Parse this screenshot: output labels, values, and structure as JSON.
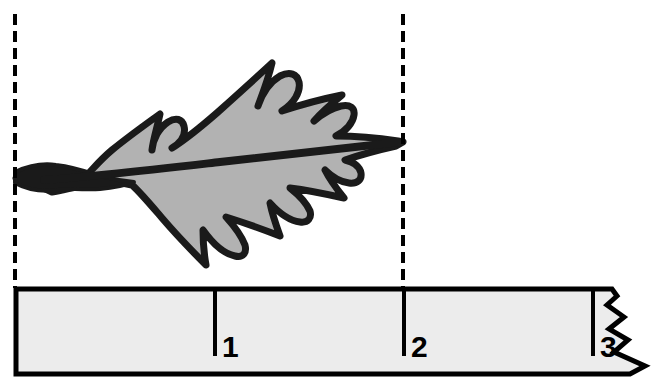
{
  "figure": {
    "kind": "leaf-measurement-diagram",
    "background_color": "#ffffff"
  },
  "leaf": {
    "name": "lobed-leaf",
    "fill_color": "#b2b2b2",
    "outline_color": "#1a1a1a",
    "midrib_color": "#1a1a1a",
    "base_x": 15,
    "tip_x": 403,
    "measured_length_units": 2
  },
  "guides": {
    "color": "#000000",
    "dash": "11 6",
    "width": 3,
    "lines": [
      {
        "name": "leaf-base-guide",
        "x": 15,
        "y_top": 14,
        "y_bottom": 288
      },
      {
        "name": "leaf-tip-guide",
        "x": 403,
        "y_top": 14,
        "y_bottom": 288
      }
    ]
  },
  "ruler": {
    "name": "ruler",
    "fill_color": "#ececec",
    "edge_color": "#000000",
    "left_x": 15,
    "top_y": 288,
    "bottom_y": 373,
    "torn_right_edge": true,
    "zero_at_x": 15,
    "ticks": [
      {
        "label": "1",
        "x": 215
      },
      {
        "label": "2",
        "x": 404
      },
      {
        "label": "3",
        "x": 593
      }
    ]
  }
}
